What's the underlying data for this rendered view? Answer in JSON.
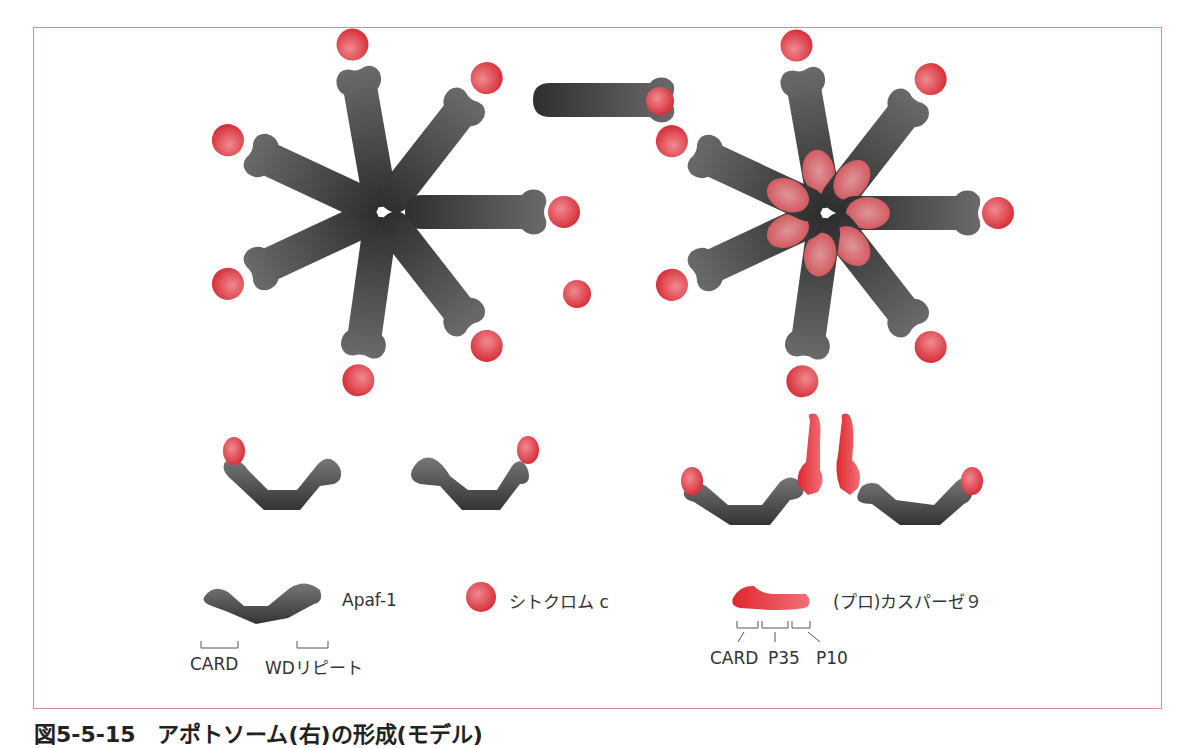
{
  "figure": {
    "caption": "図5-5-15　アポトソーム(右)の形成(モデル)",
    "colors": {
      "frame": "#d98a92",
      "apaf1": "#4a4a4a",
      "cytochrome_c": "#e0454f",
      "caspase9": "#e03a40"
    }
  },
  "legend": {
    "apaf1_label": "Apaf-1",
    "cytochrome_label": "シトクロム c",
    "caspase_label": "(プロ)カスパーゼ９",
    "apaf1_domains": [
      "CARD",
      "WDリピート"
    ],
    "caspase_domains": [
      "CARD",
      "P35",
      "P10"
    ]
  }
}
